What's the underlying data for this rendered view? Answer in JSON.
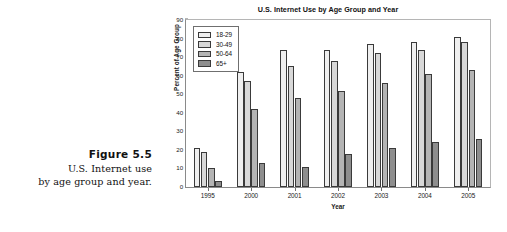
{
  "figure": {
    "number_label": "Figure 5.5",
    "caption_line_1": "U.S. Internet use",
    "caption_line_2": "by age group and year."
  },
  "chart_data": {
    "type": "bar",
    "title": "U.S. Internet Use by Age Group and Year",
    "xlabel": "Year",
    "ylabel": "Percent of Age Group",
    "categories": [
      "1995",
      "2000",
      "2001",
      "2002",
      "2003",
      "2004",
      "2005"
    ],
    "series": [
      {
        "name": "18-29",
        "color": "#efefef",
        "values": [
          21,
          62,
          74,
          74,
          77,
          78,
          81
        ]
      },
      {
        "name": "30-49",
        "color": "#d8d8d8",
        "values": [
          19,
          57,
          65,
          68,
          72,
          74,
          78
        ]
      },
      {
        "name": "50-64",
        "color": "#b4b4b4",
        "values": [
          10,
          42,
          48,
          52,
          56,
          61,
          63
        ]
      },
      {
        "name": "65+",
        "color": "#8e8e8e",
        "values": [
          3,
          13,
          11,
          18,
          21,
          24,
          26
        ]
      }
    ],
    "ylim": [
      0,
      90
    ],
    "yticks": [
      0,
      10,
      20,
      30,
      40,
      50,
      60,
      70,
      80,
      90
    ],
    "ytick_labels": [
      "0",
      "10",
      "20",
      "30",
      "40",
      "50",
      "60",
      "70",
      "80",
      "90"
    ],
    "grid": false,
    "legend_position": "upper-left",
    "legend_entries": [
      "18-29",
      "30-49",
      "50-64",
      "65+"
    ]
  }
}
